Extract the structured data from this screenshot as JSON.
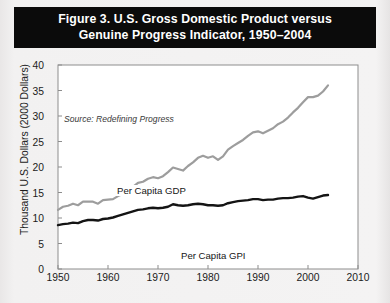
{
  "figure": {
    "title_line1": "Figure 3. U.S. Gross Domestic Product versus",
    "title_line2": "Genuine Progress Indicator, 1950–2004",
    "source_note": "Source: Redefining Progress",
    "banner_color": "#0b0b0b",
    "banner_text_color": "#ffffff",
    "background_color": "#f2f1f1"
  },
  "chart_data": {
    "type": "line",
    "title": "Figure 3. U.S. Gross Domestic Product versus Genuine Progress Indicator, 1950–2004",
    "xlabel": "",
    "ylabel": "Thousand U.S. Dollars (2000 Dollars)",
    "xlim": [
      1950,
      2010
    ],
    "ylim": [
      0,
      40
    ],
    "xticks": [
      1950,
      1960,
      1970,
      1980,
      1990,
      2000,
      2010
    ],
    "yticks": [
      0,
      5,
      10,
      15,
      20,
      25,
      30,
      35,
      40
    ],
    "grid": false,
    "legend_position": "inline-annotations",
    "annotations": [
      {
        "text": "Source: Redefining Progress",
        "x": 1951.5,
        "y": 38.3
      },
      {
        "text": "Per Capita GDP",
        "x": 1961.5,
        "y": 25.5
      },
      {
        "text": "Per Capita GPI",
        "x": 1974.5,
        "y": 12.4
      }
    ],
    "x": [
      1950,
      1951,
      1952,
      1953,
      1954,
      1955,
      1956,
      1957,
      1958,
      1959,
      1960,
      1961,
      1962,
      1963,
      1964,
      1965,
      1966,
      1967,
      1968,
      1969,
      1970,
      1971,
      1972,
      1973,
      1974,
      1975,
      1976,
      1977,
      1978,
      1979,
      1980,
      1981,
      1982,
      1983,
      1984,
      1985,
      1986,
      1987,
      1988,
      1989,
      1990,
      1991,
      1992,
      1993,
      1994,
      1995,
      1996,
      1997,
      1998,
      1999,
      2000,
      2001,
      2002,
      2003,
      2004
    ],
    "series": [
      {
        "name": "Per Capita GDP",
        "color": "#9d9d9d",
        "line_width": 2.2,
        "values": [
          11.6,
          12.2,
          12.4,
          12.8,
          12.5,
          13.2,
          13.2,
          13.2,
          12.8,
          13.5,
          13.6,
          13.7,
          14.3,
          14.7,
          15.3,
          16.1,
          16.9,
          17.1,
          17.7,
          18.0,
          17.8,
          18.2,
          19.0,
          19.9,
          19.6,
          19.3,
          20.2,
          20.9,
          21.8,
          22.2,
          21.8,
          22.1,
          21.4,
          22.1,
          23.4,
          24.1,
          24.7,
          25.3,
          26.1,
          26.8,
          27.0,
          26.6,
          27.1,
          27.6,
          28.4,
          28.9,
          29.7,
          30.7,
          31.6,
          32.7,
          33.7,
          33.7,
          34.0,
          34.8,
          36.0
        ]
      },
      {
        "name": "Per Capita GPI",
        "color": "#141414",
        "line_width": 2.4,
        "values": [
          8.6,
          8.8,
          8.9,
          9.1,
          9.0,
          9.4,
          9.6,
          9.6,
          9.5,
          9.8,
          9.9,
          10.1,
          10.4,
          10.7,
          11.0,
          11.3,
          11.6,
          11.7,
          11.9,
          12.0,
          11.9,
          12.0,
          12.2,
          12.7,
          12.5,
          12.4,
          12.5,
          12.7,
          12.8,
          12.7,
          12.5,
          12.5,
          12.4,
          12.5,
          12.9,
          13.1,
          13.3,
          13.4,
          13.5,
          13.7,
          13.7,
          13.5,
          13.6,
          13.6,
          13.8,
          13.9,
          13.9,
          14.0,
          14.2,
          14.3,
          14.0,
          13.8,
          14.1,
          14.4,
          14.5
        ]
      }
    ]
  }
}
